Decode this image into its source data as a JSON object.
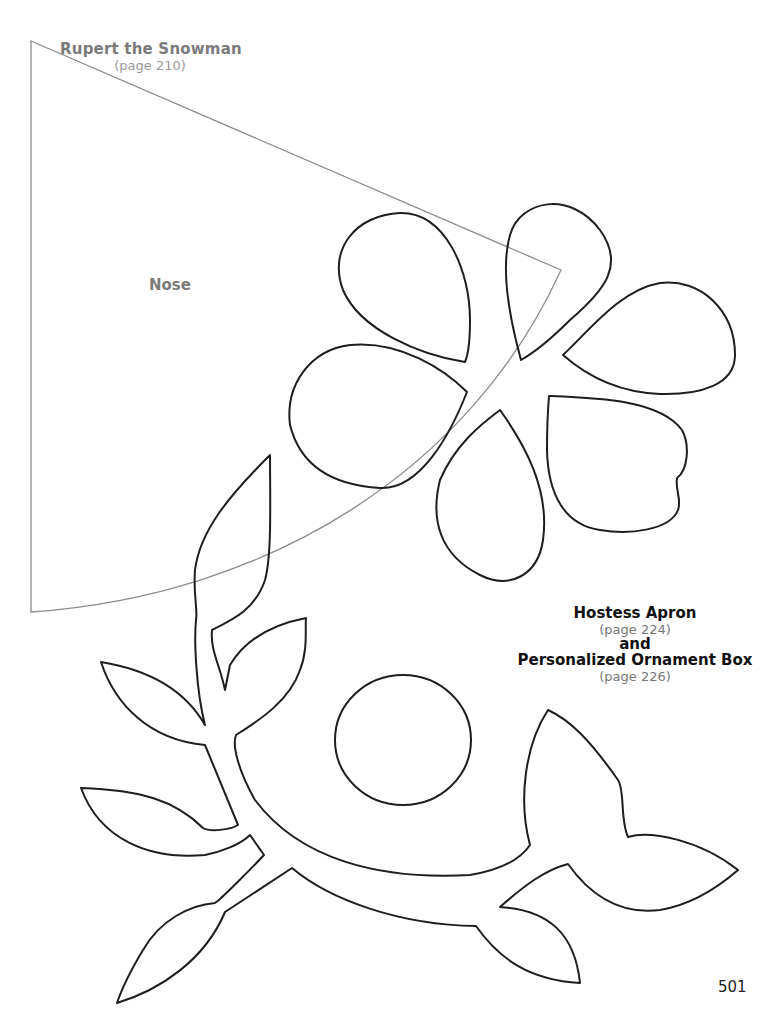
{
  "page_number": "501",
  "rupert": {
    "title": "Rupert the Snowman",
    "page_ref": "(page 210)",
    "piece_label": "Nose"
  },
  "apron": {
    "title": "Hostess Apron",
    "page_ref": "(page 224)",
    "connector": "and",
    "title2": "Personalized Ornament Box",
    "page_ref2": "(page 226)"
  },
  "colors": {
    "pattern_line": "#1e1e1e",
    "nose_line": "#8c8c8c",
    "gray_text": "#7a7a7a"
  }
}
